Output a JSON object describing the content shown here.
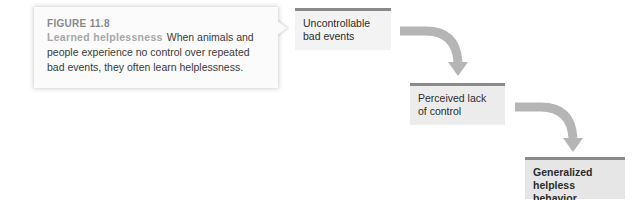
{
  "figure": {
    "number": "FIGURE 11.8",
    "title": "Learned helplessness",
    "caption": "When animals and people experience no control over repeated bad events, they often learn helplessness."
  },
  "flow": {
    "steps": [
      {
        "label": "Uncontrollable bad events"
      },
      {
        "label": "Perceived lack of control"
      },
      {
        "label": "Generalized helpless behavior"
      }
    ],
    "arrows": [
      "curved-down-arrow",
      "curved-down-arrow"
    ]
  },
  "colors": {
    "box_fill": "#eeeeee",
    "box_top_rule": "#8a8a8a",
    "arrow": "#b5b5b5",
    "title_gray": "#a7a7a7"
  }
}
